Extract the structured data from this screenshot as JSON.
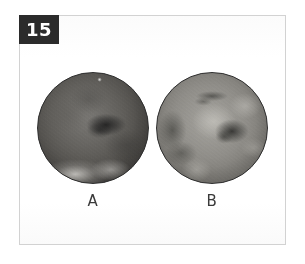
{
  "figure": {
    "number": "15",
    "badge_color": "#2b2b2b",
    "badge_text_color": "#ffffff",
    "frame_border_color": "#d2d2d2",
    "background_color": "#ffffff"
  },
  "panels": [
    {
      "id": "a",
      "label": "A",
      "icon_name": "specimen-disc-a",
      "description": "dark circular specimen",
      "tone": "dark",
      "base_color": "#5c5a56"
    },
    {
      "id": "b",
      "label": "B",
      "icon_name": "specimen-disc-b",
      "description": "lighter mottled circular specimen",
      "tone": "light",
      "base_color": "#8c8a85"
    }
  ]
}
